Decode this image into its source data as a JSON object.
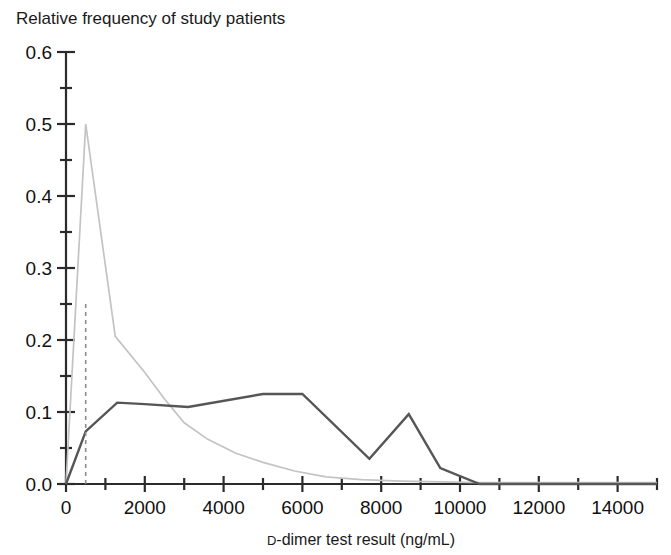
{
  "chart_data": {
    "type": "line",
    "title": "Relative frequency of study patients",
    "xlabel_prefix": "D",
    "xlabel_rest": "-dimer test result (ng/mL)",
    "xlabel": "D-dimer test result (ng/mL)",
    "ylabel": "Relative frequency of study patients",
    "xlim": [
      0,
      15000
    ],
    "ylim": [
      0.0,
      0.6
    ],
    "grid": false,
    "legend": "none",
    "x_ticks": [
      0,
      2000,
      4000,
      6000,
      8000,
      10000,
      12000,
      14000
    ],
    "x_tick_labels": [
      "0",
      "2000",
      "4000",
      "6000",
      "8000",
      "10000",
      "12000",
      "14000"
    ],
    "x_minor_step": 1000,
    "y_ticks": [
      0.0,
      0.1,
      0.2,
      0.3,
      0.4,
      0.5,
      0.6
    ],
    "y_tick_labels": [
      "0.0",
      "0.1",
      "0.2",
      "0.3",
      "0.4",
      "0.5",
      "0.6"
    ],
    "y_minor_step": 0.05,
    "series": [
      {
        "name": "patients-without-pulmonary-embolism",
        "color": "#c3c3c3",
        "width": 1.7,
        "points": [
          [
            0,
            0.0
          ],
          [
            500,
            0.5
          ],
          [
            1250,
            0.205
          ],
          [
            2000,
            0.155
          ],
          [
            2500,
            0.118
          ],
          [
            3000,
            0.085
          ],
          [
            3600,
            0.062
          ],
          [
            4300,
            0.043
          ],
          [
            5000,
            0.03
          ],
          [
            5800,
            0.018
          ],
          [
            6600,
            0.01
          ],
          [
            7500,
            0.006
          ],
          [
            8500,
            0.004
          ],
          [
            9500,
            0.003
          ],
          [
            10500,
            0.002
          ],
          [
            15000,
            0.002
          ]
        ]
      },
      {
        "name": "patients-with-pulmonary-embolism",
        "color": "#565656",
        "width": 2.4,
        "points": [
          [
            0,
            0.0
          ],
          [
            500,
            0.073
          ],
          [
            1300,
            0.113
          ],
          [
            2000,
            0.111
          ],
          [
            3100,
            0.107
          ],
          [
            5000,
            0.125
          ],
          [
            6000,
            0.125
          ],
          [
            7700,
            0.035
          ],
          [
            8700,
            0.097
          ],
          [
            9500,
            0.022
          ],
          [
            10500,
            0.0
          ],
          [
            15000,
            0.0
          ]
        ]
      }
    ],
    "threshold": {
      "name": "cutoff-500",
      "x": 500,
      "y_top": 0.25,
      "color": "#8c8c8c",
      "dash": "4,4"
    }
  },
  "plot_geometry": {
    "left": 66,
    "right": 657,
    "top": 52,
    "bottom": 484
  }
}
